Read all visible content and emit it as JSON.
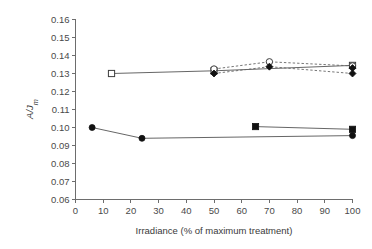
{
  "chart_data": {
    "type": "line",
    "title": "",
    "xlabel": "Irradiance (% of maximum treatment)",
    "ylabel": "A/Jm",
    "ylabel_parts": {
      "main": "A/J",
      "subscript": "m"
    },
    "xlim": [
      0,
      100
    ],
    "ylim": [
      0.06,
      0.16
    ],
    "xticks": [
      0,
      10,
      20,
      30,
      40,
      50,
      60,
      70,
      80,
      90,
      100
    ],
    "xtick_labels": [
      "0",
      "10",
      "20",
      "30",
      "40",
      "50",
      "60",
      "70",
      "80",
      "90",
      "100"
    ],
    "yticks": [
      0.06,
      0.07,
      0.08,
      0.09,
      0.1,
      0.11,
      0.12,
      0.13,
      0.14,
      0.15,
      0.16
    ],
    "ytick_labels": [
      "0.06",
      "0.07",
      "0.08",
      "0.09",
      "0.10",
      "0.11",
      "0.12",
      "0.13",
      "0.14",
      "0.15",
      "0.16"
    ],
    "grid": false,
    "legend": "none",
    "series": [
      {
        "name": "open-square-solid",
        "marker": "open-square",
        "linestyle": "solid",
        "x": [
          13,
          50,
          100
        ],
        "y": [
          0.13,
          0.1315,
          0.1345
        ]
      },
      {
        "name": "open-circle-dashed",
        "marker": "open-circle",
        "linestyle": "dashed",
        "x": [
          50,
          70,
          100
        ],
        "y": [
          0.1325,
          0.1365,
          0.1342
        ]
      },
      {
        "name": "filled-diamond-dashed",
        "marker": "filled-diamond",
        "linestyle": "dashed",
        "x": [
          50,
          70,
          100
        ],
        "y": [
          0.13,
          0.1338,
          0.13
        ]
      },
      {
        "name": "filled-circle-solid",
        "marker": "filled-circle",
        "linestyle": "solid",
        "x": [
          6,
          24,
          100
        ],
        "y": [
          0.1,
          0.094,
          0.0955
        ]
      },
      {
        "name": "filled-square-solid",
        "marker": "filled-square",
        "linestyle": "solid",
        "x": [
          65,
          100
        ],
        "y": [
          0.1005,
          0.099
        ]
      }
    ]
  },
  "colors": {
    "axis": "#6d6d6d",
    "text": "#3a3a3a",
    "line_solid": "#555555",
    "line_dashed": "#666666",
    "marker_fill": "#111111",
    "marker_open": "#ffffff",
    "background": "#ffffff"
  }
}
